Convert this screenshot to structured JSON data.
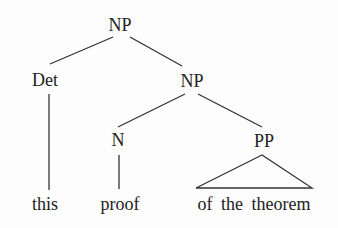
{
  "diagram": {
    "type": "syntax-tree",
    "colors": {
      "line": "#333333",
      "text": "#222222",
      "background": "#fdfdfd"
    },
    "nodes": [
      {
        "id": "np_root",
        "label": "NP",
        "x": 120,
        "y": 31
      },
      {
        "id": "det",
        "label": "Det",
        "x": 45,
        "y": 86
      },
      {
        "id": "np_sub",
        "label": "NP",
        "x": 192,
        "y": 87
      },
      {
        "id": "n",
        "label": "N",
        "x": 118,
        "y": 146
      },
      {
        "id": "pp",
        "label": "PP",
        "x": 264,
        "y": 147
      }
    ],
    "leaves": [
      {
        "id": "leaf_this",
        "label": "this",
        "x": 45,
        "y": 210
      },
      {
        "id": "leaf_proof",
        "label": "proof",
        "x": 120,
        "y": 210
      },
      {
        "id": "leaf_pp",
        "label": "of the theorem",
        "x": 254,
        "y": 210
      }
    ],
    "edges": [
      {
        "from": "np_root",
        "to": "det",
        "x1": 113,
        "y1": 37,
        "x2": 50,
        "y2": 64
      },
      {
        "from": "np_root",
        "to": "np_sub",
        "x1": 130,
        "y1": 37,
        "x2": 182,
        "y2": 66
      },
      {
        "from": "det",
        "to": "leaf_this",
        "x1": 49,
        "y1": 94,
        "x2": 49,
        "y2": 190
      },
      {
        "from": "np_sub",
        "to": "n",
        "x1": 185,
        "y1": 94,
        "x2": 118,
        "y2": 127
      },
      {
        "from": "np_sub",
        "to": "pp",
        "x1": 198,
        "y1": 94,
        "x2": 262,
        "y2": 127
      },
      {
        "from": "n",
        "to": "leaf_proof",
        "x1": 119,
        "y1": 155,
        "x2": 119,
        "y2": 189
      }
    ],
    "triangle": {
      "from": "pp",
      "to": "leaf_pp",
      "apex_x": 262,
      "apex_y": 155,
      "left_x": 196,
      "right_x": 312,
      "base_y": 188
    }
  }
}
